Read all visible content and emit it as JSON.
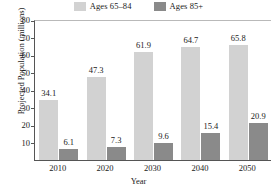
{
  "chart_data": {
    "type": "bar",
    "title": "",
    "xlabel": "Year",
    "ylabel": "Projected Population (millions)",
    "categories": [
      "2010",
      "2020",
      "2030",
      "2040",
      "2050"
    ],
    "series": [
      {
        "name": "Ages 65–84",
        "color": "#d2d2d2",
        "values": [
          34.1,
          47.3,
          61.9,
          64.7,
          65.8
        ]
      },
      {
        "name": "Ages 85+",
        "color": "#8a8a8a",
        "values": [
          6.1,
          7.3,
          9.6,
          15.4,
          20.9
        ]
      }
    ],
    "ylim": [
      0,
      80
    ],
    "yticks": [
      10,
      20,
      30,
      40,
      50,
      60,
      70,
      80
    ],
    "ytick_labels": [
      "10",
      "20",
      "30",
      "40",
      "50",
      "60",
      "70",
      "80"
    ],
    "grid": false,
    "legend_position": "top",
    "data_labels": [
      "34.1",
      "6.1",
      "47.3",
      "7.3",
      "61.9",
      "9.6",
      "64.7",
      "15.4",
      "65.8",
      "20.9"
    ]
  },
  "legend": {
    "items": [
      {
        "label": "Ages 65–84",
        "color": "#d2d2d2"
      },
      {
        "label": "Ages 85+",
        "color": "#8a8a8a"
      }
    ]
  },
  "axes": {
    "y_title": "Projected Population (millions)",
    "x_title": "Year"
  }
}
